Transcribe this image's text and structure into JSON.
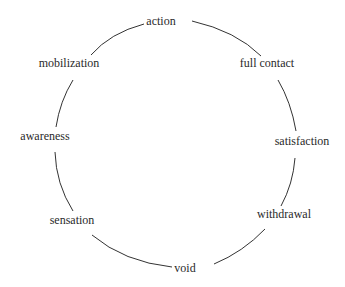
{
  "diagram": {
    "type": "cycle",
    "stages": [
      {
        "id": "action",
        "label": "action"
      },
      {
        "id": "full-contact",
        "label": "full contact"
      },
      {
        "id": "satisfaction",
        "label": "satisfaction"
      },
      {
        "id": "withdrawal",
        "label": "withdrawal"
      },
      {
        "id": "void",
        "label": "void"
      },
      {
        "id": "sensation",
        "label": "sensation"
      },
      {
        "id": "awareness",
        "label": "awareness"
      },
      {
        "id": "mobilization",
        "label": "mobilization"
      }
    ],
    "colors": {
      "line": "#333333",
      "text": "#2a2a2a",
      "background": "#ffffff"
    }
  }
}
